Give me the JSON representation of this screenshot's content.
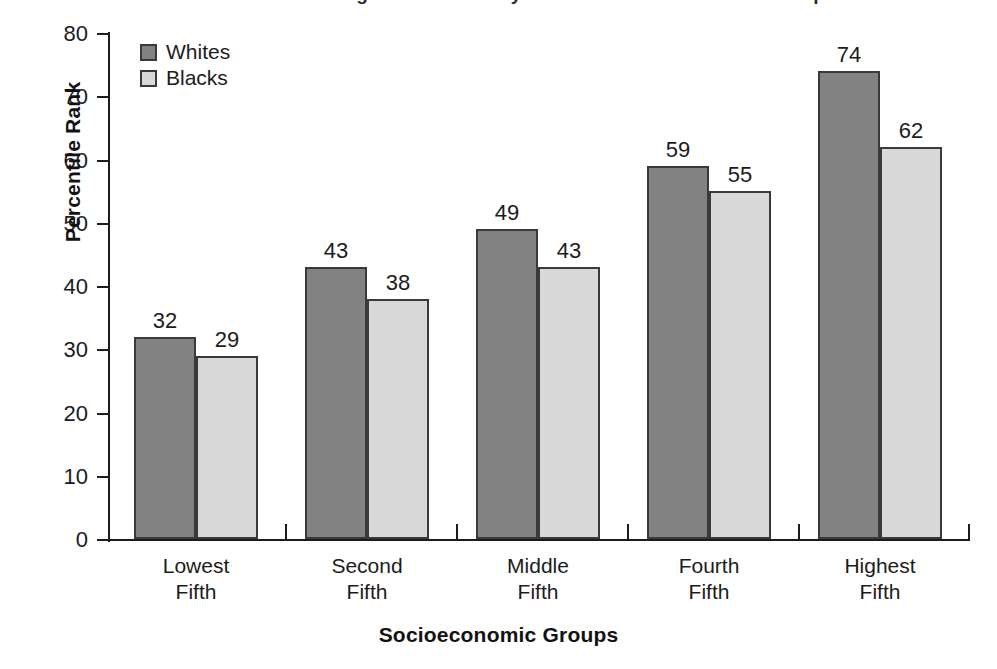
{
  "clipped_title": "Percentile Rank in Reading Achievement by Race and Socioeconomic Group",
  "chart_data": {
    "type": "bar",
    "title": "",
    "xlabel": "Socioeconomic Groups",
    "ylabel": "Percentile Rank",
    "categories": [
      "Lowest Fifth",
      "Second Fifth",
      "Middle Fifth",
      "Fourth Fifth",
      "Highest Fifth"
    ],
    "category_lines": [
      [
        "Lowest",
        "Fifth"
      ],
      [
        "Second",
        "Fifth"
      ],
      [
        "Middle",
        "Fifth"
      ],
      [
        "Fourth",
        "Fifth"
      ],
      [
        "Highest",
        "Fifth"
      ]
    ],
    "series": [
      {
        "name": "Whites",
        "color": "#828282",
        "values": [
          32,
          43,
          49,
          59,
          74
        ]
      },
      {
        "name": "Blacks",
        "color": "#d8d8d8",
        "values": [
          29,
          38,
          43,
          55,
          62
        ]
      }
    ],
    "ylim": [
      0,
      80
    ],
    "ytick_step": 10,
    "yticks": [
      80,
      70,
      60,
      50,
      40,
      30,
      20,
      10,
      0
    ],
    "grid": false,
    "legend_position": "top-left-inside",
    "data_labels": true,
    "axis_color": "#1c1c1c",
    "bar_outline_color": "#3a3a3a",
    "background": "#ffffff"
  }
}
